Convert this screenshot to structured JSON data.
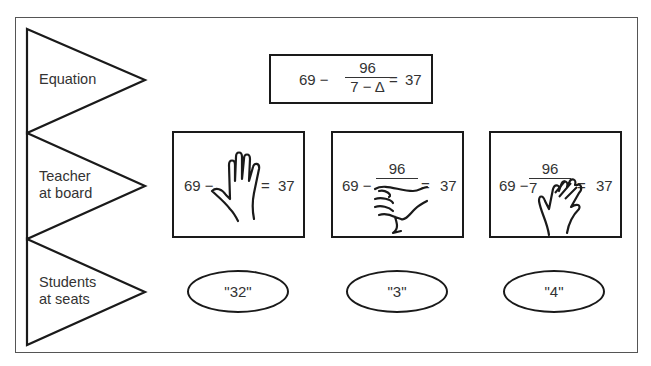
{
  "rows": [
    {
      "id": "equation",
      "label_lines": [
        "Equation"
      ]
    },
    {
      "id": "teacher",
      "label_lines": [
        "Teacher",
        "at board"
      ]
    },
    {
      "id": "students",
      "label_lines": [
        "Students",
        "at seats"
      ]
    }
  ],
  "equation": {
    "left": "69 −",
    "numerator": "96",
    "denominator": "7 − Δ",
    "equals": "=",
    "right": "37"
  },
  "teacher_boards": [
    {
      "left": "69 −",
      "numerator": "",
      "denominator": "",
      "equals": "=",
      "right": "37",
      "hand": "hand-covering-fraction-icon"
    },
    {
      "left": "69 −",
      "numerator": "96",
      "denominator": "",
      "equals": "=",
      "right": "37",
      "hand": "hand-covering-denominator-icon"
    },
    {
      "left": "69 −",
      "numerator": "96",
      "denominator": "7",
      "equals": "=",
      "right": "37",
      "hand": "hand-covering-delta-icon"
    }
  ],
  "student_answers": [
    "\"32\"",
    "\"3\"",
    "\"4\""
  ],
  "colors": {
    "stroke": "#1a1a1a",
    "text": "#333333",
    "background": "#ffffff"
  }
}
